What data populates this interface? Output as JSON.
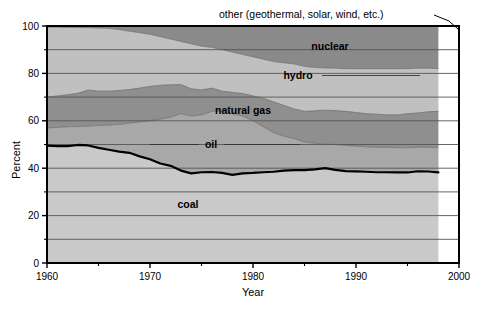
{
  "chart_data": {
    "type": "area",
    "title": "",
    "subtitle": "",
    "xlabel": "Year",
    "ylabel": "Percent",
    "xlim": [
      1960,
      2000
    ],
    "ylim": [
      0,
      100
    ],
    "grid": true,
    "grid_axis": "y",
    "grid_interval": 10,
    "legend_position": "inline-annotations",
    "stacked": true,
    "stack_order_bottom_to_top": [
      "coal",
      "oil",
      "natural gas",
      "hydro",
      "nuclear",
      "other (geothermal, solar, wind, etc.)"
    ],
    "x_tick_labels": [
      "1960",
      "1970",
      "1980",
      "1990",
      "2000"
    ],
    "x_tick_values": [
      1960,
      1970,
      1980,
      1990,
      2000
    ],
    "x_minor_tick_values": [
      1965,
      1975,
      1985,
      1995
    ],
    "y_tick_labels": [
      "0",
      "20",
      "40",
      "60",
      "80",
      "100"
    ],
    "y_tick_values": [
      0,
      20,
      40,
      60,
      80,
      100
    ],
    "y_minor_tick_values": [
      10,
      30,
      50,
      70,
      90
    ],
    "data_end_year": 1998,
    "x": [
      1960,
      1961,
      1962,
      1963,
      1964,
      1965,
      1966,
      1967,
      1968,
      1969,
      1970,
      1971,
      1972,
      1973,
      1974,
      1975,
      1976,
      1977,
      1978,
      1979,
      1980,
      1981,
      1982,
      1983,
      1984,
      1985,
      1986,
      1987,
      1988,
      1989,
      1990,
      1991,
      1992,
      1993,
      1994,
      1995,
      1996,
      1997,
      1998
    ],
    "series": [
      {
        "name": "coal",
        "color": "#c9c9c9",
        "cumulative_top": [
          49.5,
          49.3,
          49.3,
          49.8,
          49.6,
          48.6,
          47.8,
          47.0,
          46.5,
          45.0,
          43.8,
          42.0,
          41.0,
          39.0,
          37.8,
          38.3,
          38.4,
          38.0,
          37.2,
          37.8,
          38.0,
          38.3,
          38.5,
          39.0,
          39.2,
          39.2,
          39.5,
          40.0,
          39.3,
          38.8,
          38.7,
          38.5,
          38.3,
          38.3,
          38.2,
          38.2,
          38.7,
          38.6,
          38.2
        ],
        "values": [
          49.5,
          49.3,
          49.3,
          49.8,
          49.6,
          48.6,
          47.8,
          47.0,
          46.5,
          45.0,
          43.8,
          42.0,
          41.0,
          39.0,
          37.8,
          38.3,
          38.4,
          38.0,
          37.2,
          37.8,
          38.0,
          38.3,
          38.5,
          39.0,
          39.2,
          39.2,
          39.5,
          40.0,
          39.3,
          38.8,
          38.7,
          38.5,
          38.3,
          38.3,
          38.2,
          38.2,
          38.7,
          38.6,
          38.2
        ]
      },
      {
        "name": "oil",
        "color": "#a8a8a8",
        "cumulative_top": [
          57.0,
          57.2,
          57.5,
          57.6,
          57.8,
          58.0,
          58.2,
          58.5,
          59.0,
          59.5,
          60.0,
          60.7,
          61.5,
          63.0,
          62.0,
          62.5,
          64.0,
          64.0,
          63.0,
          62.0,
          60.0,
          57.5,
          55.0,
          53.5,
          52.5,
          51.0,
          50.5,
          50.2,
          50.0,
          49.6,
          49.3,
          49.0,
          48.8,
          48.8,
          48.7,
          48.6,
          48.9,
          48.8,
          48.6
        ],
        "values": [
          7.5,
          7.9,
          8.2,
          7.8,
          8.2,
          9.4,
          10.4,
          11.5,
          12.5,
          14.5,
          16.2,
          18.7,
          20.5,
          24.0,
          24.2,
          24.2,
          25.6,
          26.0,
          25.8,
          24.2,
          22.0,
          19.2,
          16.5,
          14.5,
          13.3,
          11.8,
          11.0,
          10.2,
          10.7,
          10.8,
          10.6,
          10.5,
          10.5,
          10.5,
          10.5,
          10.4,
          10.2,
          10.2,
          10.4
        ]
      },
      {
        "name": "natural gas",
        "color": "#8f8f8f",
        "cumulative_top": [
          70.0,
          70.5,
          71.0,
          71.6,
          73.0,
          72.5,
          72.5,
          72.8,
          73.2,
          73.8,
          74.5,
          75.0,
          75.2,
          75.3,
          73.5,
          73.0,
          73.8,
          72.5,
          72.0,
          71.5,
          70.5,
          69.5,
          68.0,
          66.5,
          65.0,
          64.0,
          64.2,
          64.5,
          64.3,
          64.0,
          63.5,
          63.0,
          62.8,
          62.5,
          62.5,
          63.0,
          63.3,
          63.8,
          64.0
        ],
        "values": [
          13.0,
          13.3,
          13.5,
          14.0,
          15.2,
          14.5,
          14.3,
          14.3,
          14.2,
          14.3,
          14.5,
          14.3,
          13.7,
          12.3,
          11.5,
          10.5,
          9.8,
          8.5,
          9.0,
          9.5,
          10.5,
          12.0,
          13.0,
          13.0,
          12.5,
          13.0,
          13.7,
          14.3,
          14.3,
          14.4,
          14.2,
          14.0,
          14.0,
          13.7,
          13.8,
          14.4,
          14.4,
          15.0,
          15.4
        ]
      },
      {
        "name": "hydro",
        "color": "#c0c0c0",
        "cumulative_top": [
          99.5,
          99.5,
          99.4,
          99.4,
          99.3,
          99.2,
          99.0,
          98.5,
          97.8,
          97.2,
          96.5,
          95.5,
          94.5,
          93.5,
          92.5,
          91.5,
          91.0,
          90.0,
          89.0,
          88.0,
          87.0,
          86.0,
          85.0,
          84.5,
          84.0,
          83.0,
          82.5,
          82.3,
          82.2,
          82.0,
          82.0,
          82.0,
          82.0,
          82.0,
          82.0,
          82.0,
          82.2,
          82.2,
          82.0
        ],
        "values": [
          29.5,
          29.0,
          28.4,
          27.8,
          26.3,
          26.7,
          26.5,
          25.7,
          24.6,
          23.4,
          22.0,
          20.5,
          19.3,
          18.2,
          19.0,
          18.5,
          17.2,
          17.5,
          17.0,
          16.5,
          16.5,
          16.5,
          17.0,
          18.0,
          19.0,
          19.0,
          18.3,
          17.8,
          17.9,
          18.0,
          18.5,
          19.0,
          19.2,
          19.5,
          19.5,
          19.0,
          18.9,
          18.4,
          18.0
        ]
      },
      {
        "name": "nuclear",
        "color": "#8a8a8a",
        "cumulative_top": [
          99.8,
          99.8,
          99.8,
          99.8,
          99.8,
          99.8,
          99.8,
          99.8,
          99.8,
          99.8,
          99.8,
          99.8,
          99.8,
          99.8,
          99.8,
          99.8,
          99.8,
          99.8,
          99.8,
          99.8,
          99.8,
          99.8,
          99.8,
          99.8,
          99.8,
          99.8,
          99.8,
          99.8,
          99.8,
          99.8,
          99.8,
          99.8,
          99.8,
          99.8,
          99.8,
          99.8,
          99.8,
          99.8,
          99.8
        ],
        "values": [
          0.3,
          0.3,
          0.4,
          0.4,
          0.5,
          0.6,
          0.8,
          1.3,
          2.0,
          2.6,
          3.3,
          4.3,
          5.3,
          6.3,
          7.3,
          8.3,
          8.8,
          9.8,
          10.8,
          11.8,
          12.8,
          13.8,
          14.8,
          15.3,
          15.8,
          16.8,
          17.3,
          17.5,
          17.6,
          17.8,
          17.8,
          17.8,
          17.8,
          17.8,
          17.8,
          17.8,
          17.6,
          17.6,
          17.8
        ]
      },
      {
        "name": "other (geothermal, solar, wind, etc.)",
        "color": "#5a5a5a",
        "cumulative_top": [
          100,
          100,
          100,
          100,
          100,
          100,
          100,
          100,
          100,
          100,
          100,
          100,
          100,
          100,
          100,
          100,
          100,
          100,
          100,
          100,
          100,
          100,
          100,
          100,
          100,
          100,
          100,
          100,
          100,
          100,
          100,
          100,
          100,
          100,
          100,
          100,
          100,
          100,
          100
        ],
        "values": [
          0.2,
          0.2,
          0.2,
          0.2,
          0.2,
          0.2,
          0.2,
          0.2,
          0.2,
          0.2,
          0.2,
          0.2,
          0.2,
          0.2,
          0.2,
          0.2,
          0.2,
          0.2,
          0.2,
          0.2,
          0.2,
          0.2,
          0.2,
          0.2,
          0.2,
          0.2,
          0.2,
          0.2,
          0.2,
          0.2,
          0.2,
          0.2,
          0.2,
          0.2,
          0.2,
          0.2,
          0.2,
          0.2,
          0.2
        ]
      }
    ],
    "annotations": [
      {
        "text": "other (geothermal, solar, wind, etc.)",
        "has_leader_line": true
      },
      {
        "text": "nuclear",
        "has_leader_line": false
      },
      {
        "text": "hydro",
        "has_leader_line": true
      },
      {
        "text": "natural gas",
        "has_leader_line": false
      },
      {
        "text": "oil",
        "has_leader_line": true
      },
      {
        "text": "coal",
        "has_leader_line": false
      }
    ]
  },
  "labels": {
    "other": "other (geothermal, solar, wind, etc.)",
    "nuclear": "nuclear",
    "hydro": "hydro",
    "natural_gas": "natural gas",
    "oil": "oil",
    "coal": "coal"
  },
  "axes": {
    "y_title": "Percent",
    "x_title": "Year",
    "y_ticks": [
      "100",
      "80",
      "60",
      "40",
      "20",
      "0"
    ],
    "x_ticks": [
      "1960",
      "1970",
      "1980",
      "1990",
      "2000"
    ]
  },
  "colors": {
    "coal": "#c9c9c9",
    "oil": "#a8a8a8",
    "natural_gas": "#8f8f8f",
    "hydro": "#c0c0c0",
    "nuclear": "#8a8a8a",
    "other": "#5a5a5a",
    "frame": "#000000",
    "gridline": "#555555",
    "coal_boundary": "#000000",
    "background": "#ffffff"
  }
}
